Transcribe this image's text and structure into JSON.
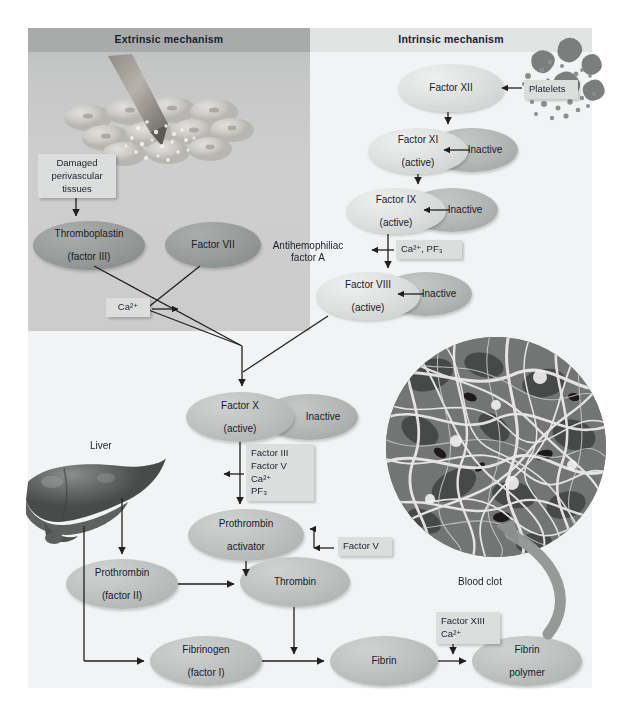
{
  "figure": {
    "title_extrinsic": "Extrinsic mechanism",
    "title_intrinsic": "Intrinsic mechanism"
  },
  "labels": {
    "damaged_tissue": "Damaged\nperivascular\ntissues",
    "damaged_tissue_l1": "Damaged",
    "damaged_tissue_l2": "perivascular",
    "damaged_tissue_l3": "tissues",
    "platelets": "Platelets",
    "antihemophiliac_l1": "Antihemophiliac",
    "antihemophiliac_l2": "factor A",
    "liver": "Liver",
    "blood_clot": "Blood clot",
    "inactive": "Inactive"
  },
  "nodes": {
    "factor_xii": {
      "line1": "Factor XII",
      "line2": ""
    },
    "factor_xi": {
      "line1": "Factor XI",
      "line2": "(active)"
    },
    "factor_ix": {
      "line1": "Factor IX",
      "line2": "(active)"
    },
    "factor_viii": {
      "line1": "Factor VIII",
      "line2": "(active)"
    },
    "thromboplastin": {
      "line1": "Thromboplastin",
      "line2": "(factor III)"
    },
    "factor_vii": {
      "line1": "Factor VII",
      "line2": ""
    },
    "factor_x": {
      "line1": "Factor X",
      "line2": "(active)"
    },
    "prothrombin_activator": {
      "line1": "Prothrombin",
      "line2": "activator"
    },
    "prothrombin": {
      "line1": "Prothrombin",
      "line2": "(factor II)"
    },
    "thrombin": {
      "line1": "Thrombin",
      "line2": ""
    },
    "fibrinogen": {
      "line1": "Fibrinogen",
      "line2": "(factor I)"
    },
    "fibrin": {
      "line1": "Fibrin",
      "line2": ""
    },
    "fibrin_polymer": {
      "line1": "Fibrin",
      "line2": "polymer"
    }
  },
  "cofactor_boxes": {
    "ca_pf3": "Ca²⁺, PF₃",
    "ca_extrinsic": "Ca²⁺",
    "factor_x_cofactors": [
      "Factor III",
      "Factor V",
      "Ca²⁺",
      "PF₃"
    ],
    "factor_v": "Factor V",
    "factor_xiii_ca": [
      "Factor XIII",
      "Ca²⁺"
    ]
  },
  "colors": {
    "panel_extrinsic": "#c9cac9",
    "panel_intrinsic": "#f2f3f4",
    "header_band_extrinsic": "#a9abab",
    "header_band_intrinsic": "#e2e3e3",
    "callout_box": "#dcdddd",
    "ellipse_active": "#dfe1e0",
    "ellipse_inactive": "#aeb2b0",
    "arrow_stroke": "#1f1f1f",
    "text": "#16212c",
    "liver": "#6a6c6b",
    "clot_arrow": "#8c8f8e"
  }
}
